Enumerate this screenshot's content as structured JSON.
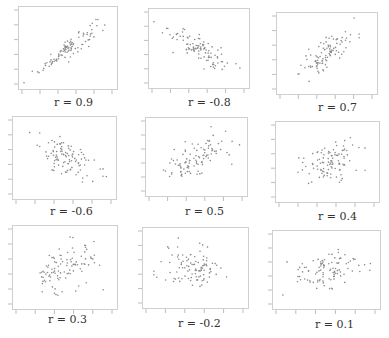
{
  "chart_data": [
    {
      "type": "scatter",
      "title": "r = 0.9",
      "r": 0.9,
      "n": 100,
      "frame": {
        "x": 18,
        "y": 6,
        "w": 100,
        "h": 84
      },
      "label_pos": {
        "x": 54,
        "y": 96
      }
    },
    {
      "type": "scatter",
      "title": "r = -0.8",
      "r": -0.8,
      "n": 100,
      "frame": {
        "x": 148,
        "y": 8,
        "w": 102,
        "h": 81
      },
      "label_pos": {
        "x": 188,
        "y": 96
      }
    },
    {
      "type": "scatter",
      "title": "r = 0.7",
      "r": 0.7,
      "n": 100,
      "frame": {
        "x": 276,
        "y": 12,
        "w": 102,
        "h": 83
      },
      "label_pos": {
        "x": 318,
        "y": 101
      }
    },
    {
      "type": "scatter",
      "title": "r = -0.6",
      "r": -0.6,
      "n": 100,
      "frame": {
        "x": 12,
        "y": 116,
        "w": 105,
        "h": 84
      },
      "label_pos": {
        "x": 50,
        "y": 205
      }
    },
    {
      "type": "scatter",
      "title": "r = 0.5",
      "r": 0.5,
      "n": 100,
      "frame": {
        "x": 145,
        "y": 117,
        "w": 103,
        "h": 80
      },
      "label_pos": {
        "x": 185,
        "y": 205
      }
    },
    {
      "type": "scatter",
      "title": "r = 0.4",
      "r": 0.4,
      "n": 100,
      "frame": {
        "x": 275,
        "y": 121,
        "w": 105,
        "h": 82
      },
      "label_pos": {
        "x": 318,
        "y": 210
      }
    },
    {
      "type": "scatter",
      "title": "r = 0.3",
      "r": 0.3,
      "n": 100,
      "frame": {
        "x": 12,
        "y": 225,
        "w": 106,
        "h": 85
      },
      "label_pos": {
        "x": 48,
        "y": 313
      }
    },
    {
      "type": "scatter",
      "title": "r = -0.2",
      "r": -0.2,
      "n": 100,
      "frame": {
        "x": 142,
        "y": 227,
        "w": 107,
        "h": 82
      },
      "label_pos": {
        "x": 178,
        "y": 317
      }
    },
    {
      "type": "scatter",
      "title": "r = 0.1",
      "r": 0.1,
      "n": 100,
      "frame": {
        "x": 272,
        "y": 230,
        "w": 109,
        "h": 80
      },
      "label_pos": {
        "x": 315,
        "y": 318
      }
    }
  ],
  "colors": {
    "frame": "#cfcfcf",
    "ticks": "#bdbdbd",
    "points": "#8a8a8a",
    "text": "#333333"
  }
}
